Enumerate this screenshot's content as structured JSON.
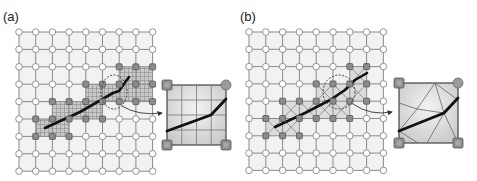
{
  "figure": {
    "panels": [
      {
        "id": "a",
        "label": "(a)",
        "label_pos": [
          3,
          22
        ],
        "grid": {
          "x0": 19,
          "y0": 32,
          "dx": 16.7,
          "dy": 17.4,
          "n": 9
        },
        "highlight_cells": [
          [
            1,
            5
          ],
          [
            2,
            5
          ],
          [
            2,
            4
          ],
          [
            3,
            4
          ],
          [
            4,
            4
          ],
          [
            4,
            3
          ],
          [
            5,
            3
          ],
          [
            6,
            2
          ],
          [
            6,
            3
          ],
          [
            7,
            2
          ],
          [
            7,
            3
          ]
        ],
        "highlight_style": "hatched",
        "curve": [
          [
            45,
            128
          ],
          [
            80,
            112
          ],
          [
            113,
            93
          ],
          [
            119,
            91
          ],
          [
            129,
            77
          ]
        ],
        "focus_ellipse": {
          "cx": 114,
          "cy": 92,
          "rx": 13,
          "ry": 17
        },
        "arrow": {
          "from": [
            122,
            106
          ],
          "ctrl": [
            138,
            116
          ],
          "to": [
            162,
            113
          ]
        },
        "inset": {
          "box": [
            167,
            85,
            226,
            145
          ],
          "subdivisions": 4,
          "style": "grid",
          "curve": [
            [
              167,
              131
            ],
            [
              211,
              115
            ],
            [
              226,
              99
            ]
          ],
          "corner_markers": [
            "square",
            "circle",
            "square",
            "square"
          ]
        }
      },
      {
        "id": "b",
        "label": "(b)",
        "label_pos": [
          240,
          22
        ],
        "grid": {
          "x0": 249,
          "y0": 32,
          "dx": 16.8,
          "dy": 17.3,
          "n": 9
        },
        "highlight_cells": [
          [
            1,
            5
          ],
          [
            2,
            5
          ],
          [
            2,
            4
          ],
          [
            3,
            4
          ],
          [
            4,
            4
          ],
          [
            4,
            3
          ],
          [
            5,
            3
          ],
          [
            5,
            4
          ],
          [
            6,
            2
          ],
          [
            6,
            3
          ]
        ],
        "highlight_style": "triangulated",
        "curve": [
          [
            275,
            127
          ],
          [
            305,
            113
          ],
          [
            330,
            100
          ],
          [
            345,
            90
          ],
          [
            355,
            80
          ],
          [
            367,
            73
          ]
        ],
        "focus_ellipse": {
          "cx": 339,
          "cy": 92,
          "rx": 16,
          "ry": 17
        },
        "arrow": {
          "from": [
            353,
            104
          ],
          "ctrl": [
            370,
            116
          ],
          "to": [
            392,
            112
          ]
        },
        "inset": {
          "box": [
            399,
            83,
            458,
            143
          ],
          "style": "triangulated",
          "curve": [
            [
              399,
              131
            ],
            [
              444,
              113
            ],
            [
              458,
              98
            ]
          ],
          "tri_edges": [
            [
              [
                435,
                83
              ],
              [
                417,
                109
              ]
            ],
            [
              [
                435,
                83
              ],
              [
                444,
                113
              ]
            ],
            [
              [
                435,
                83
              ],
              [
                458,
                100
              ]
            ],
            [
              [
                417,
                109
              ],
              [
                399,
                103
              ]
            ],
            [
              [
                417,
                109
              ],
              [
                444,
                113
              ]
            ],
            [
              [
                417,
                109
              ],
              [
                399,
                131
              ]
            ],
            [
              [
                444,
                113
              ],
              [
                427,
                143
              ]
            ],
            [
              [
                444,
                113
              ],
              [
                458,
                143
              ]
            ],
            [
              [
                399,
                131
              ],
              [
                418,
                143
              ]
            ]
          ],
          "corner_markers": [
            "square",
            "circle",
            "square",
            "square"
          ]
        }
      }
    ]
  },
  "colors": {
    "grid_line": "#8a8a8a",
    "grid_fill_light": "#f2f2f2",
    "grid_fill_shade": "#dcdcdc",
    "node_fill": "#ffffff",
    "node_stroke": "#888888",
    "active_node": "#8c8c8c",
    "active_node_stroke": "#555555",
    "curve": "#111111",
    "hatch": "#9a9a9a",
    "inset_fill": "#d9d9d9",
    "ellipse": "#333333"
  }
}
